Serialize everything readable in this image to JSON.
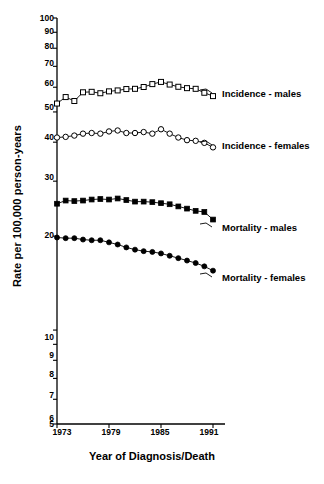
{
  "chart_data": {
    "type": "line",
    "title": "",
    "xlabel": "Year of Diagnosis/Death",
    "ylabel": "Rate per 100,000 person-years",
    "yscale": "log",
    "ylim": [
      5,
      100
    ],
    "xlim": [
      1973,
      1991
    ],
    "grid": false,
    "legend_position": "inline-right",
    "ytick_labels": [
      "100",
      "90",
      "80",
      "70",
      "60",
      "50",
      "40",
      "30",
      "20",
      "10",
      "9",
      "8",
      "7",
      "6",
      "5"
    ],
    "ytick_values": [
      100,
      90,
      80,
      70,
      60,
      50,
      40,
      30,
      20,
      10,
      9,
      8,
      7,
      6,
      5
    ],
    "xtick_labels": [
      "1973",
      "1979",
      "1985",
      "1991"
    ],
    "xtick_values": [
      1973,
      1979,
      1985,
      1991
    ],
    "x": [
      1973,
      1974,
      1975,
      1976,
      1977,
      1978,
      1979,
      1980,
      1981,
      1982,
      1983,
      1984,
      1985,
      1986,
      1987,
      1988,
      1989,
      1990,
      1991
    ],
    "series": [
      {
        "name": "Incidence - males",
        "marker": "open-square",
        "color": "#000000",
        "values": [
          53.2,
          55.8,
          54.2,
          57.8,
          58.0,
          57.4,
          58.2,
          58.6,
          59.2,
          59.3,
          60.1,
          61.4,
          62.4,
          61.2,
          60.2,
          59.6,
          59.3,
          57.6,
          56.2
        ]
      },
      {
        "name": "Incidence - females",
        "marker": "open-circle",
        "color": "#000000",
        "values": [
          41.4,
          41.6,
          42.0,
          42.6,
          42.8,
          42.6,
          43.3,
          43.6,
          42.8,
          42.8,
          43.1,
          42.6,
          44.0,
          42.6,
          41.4,
          40.6,
          40.4,
          39.8,
          38.5
        ]
      },
      {
        "name": "Mortality - males",
        "marker": "filled-square",
        "color": "#000000",
        "values": [
          25.4,
          26.0,
          25.9,
          26.0,
          26.2,
          26.3,
          26.2,
          26.4,
          26.1,
          25.8,
          25.8,
          25.7,
          25.5,
          25.3,
          24.9,
          24.5,
          24.1,
          23.9,
          22.6
        ]
      },
      {
        "name": "Mortality - females",
        "marker": "filled-circle",
        "color": "#000000",
        "values": [
          19.8,
          19.7,
          19.7,
          19.5,
          19.4,
          19.4,
          19.1,
          18.8,
          18.4,
          18.1,
          17.9,
          17.8,
          17.6,
          17.3,
          17.0,
          16.7,
          16.4,
          16.0,
          15.5
        ]
      }
    ]
  },
  "axis": {
    "x_title": "Year of Diagnosis/Death",
    "y_title": "Rate per 100,000 person-years"
  }
}
